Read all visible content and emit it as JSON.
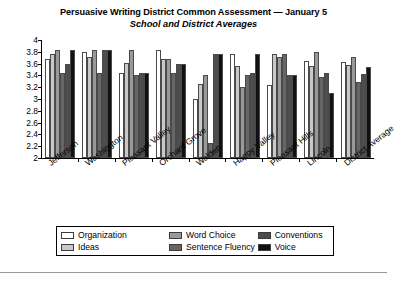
{
  "chart_data": {
    "type": "bar",
    "title": "Persuasive Writing District Common Assessment — January 5",
    "subtitle": "School and District Averages",
    "xlabel": "",
    "ylabel": "",
    "ylim": [
      2,
      4
    ],
    "ytick_step": 0.2,
    "ytick_labels": [
      "4",
      "3.8",
      "3.6",
      "3.4",
      "3.2",
      "3",
      "2.8",
      "2.6",
      "2.4",
      "2.2",
      "2"
    ],
    "grid": false,
    "legend_position": "bottom",
    "categories": [
      "Jefferson",
      "Washington",
      "Pleasant Valley",
      "Orchard Grove",
      "Walden",
      "Happy Valley",
      "Pleasant Hills",
      "Lincoln",
      "District Average"
    ],
    "series": [
      {
        "name": "Organization",
        "color": "#ffffff",
        "values": [
          3.67,
          3.79,
          3.44,
          3.83,
          3.0,
          3.76,
          3.23,
          3.64,
          3.63
        ]
      },
      {
        "name": "Ideas",
        "color": "#c8c8c8",
        "values": [
          3.76,
          3.72,
          3.61,
          3.67,
          3.26,
          3.56,
          3.76,
          3.56,
          3.58
        ]
      },
      {
        "name": "Word Choice",
        "color": "#999999",
        "values": [
          3.83,
          3.83,
          3.83,
          3.67,
          3.41,
          3.2,
          3.72,
          3.79,
          3.71
        ]
      },
      {
        "name": "Sentence Fluency",
        "color": "#666666",
        "values": [
          3.44,
          3.44,
          3.41,
          3.44,
          2.25,
          3.4,
          3.76,
          3.37,
          3.28
        ]
      },
      {
        "name": "Conventions",
        "color": "#4d4d4d",
        "values": [
          3.6,
          3.83,
          3.44,
          3.6,
          3.76,
          3.44,
          3.4,
          3.44,
          3.43
        ]
      },
      {
        "name": "Voice",
        "color": "#111111",
        "values": [
          3.83,
          3.83,
          3.44,
          3.6,
          3.76,
          3.76,
          3.4,
          3.1,
          3.55
        ]
      }
    ]
  }
}
